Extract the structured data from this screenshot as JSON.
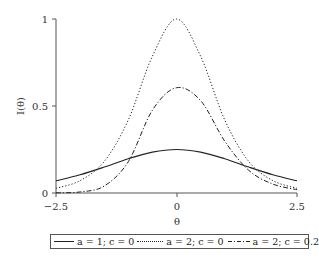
{
  "chart_data": {
    "type": "line",
    "title": "",
    "xlabel": "θ",
    "ylabel": "I(θ)",
    "xlim": [
      -2.5,
      2.5
    ],
    "ylim": [
      0,
      1
    ],
    "xticks": [
      "-2.5",
      "0",
      "2.5"
    ],
    "yticks": [
      "0",
      "0.5",
      "1"
    ],
    "grid": false,
    "legend_position": "bottom",
    "x": [
      -2.5,
      -2.0,
      -1.5,
      -1.0,
      -0.5,
      0.0,
      0.5,
      1.0,
      1.5,
      2.0,
      2.5
    ],
    "series": [
      {
        "name": "a = 1; c = 0",
        "style": "solid",
        "values": [
          0.07,
          0.105,
          0.149,
          0.197,
          0.235,
          0.25,
          0.235,
          0.197,
          0.149,
          0.105,
          0.07
        ]
      },
      {
        "name": "a = 2; c = 0",
        "style": "dotted",
        "values": [
          0.027,
          0.071,
          0.181,
          0.42,
          0.786,
          1.0,
          0.786,
          0.42,
          0.181,
          0.071,
          0.027
        ]
      },
      {
        "name": "a = 2; c = 0.25",
        "style": "dashdot",
        "values": [
          0.001,
          0.006,
          0.04,
          0.18,
          0.476,
          0.605,
          0.531,
          0.298,
          0.13,
          0.051,
          0.019
        ]
      }
    ]
  },
  "axes": {
    "xlabel": "θ",
    "ylabel": "I(θ)",
    "xticks": [
      "−2.5",
      "0",
      "2.5"
    ],
    "yticks": [
      "0",
      "0.5",
      "1"
    ]
  },
  "legend": {
    "items": [
      {
        "label": "a = 1; c = 0"
      },
      {
        "label": "a = 2; c = 0"
      },
      {
        "label": "a = 2; c = 0.25"
      }
    ]
  }
}
